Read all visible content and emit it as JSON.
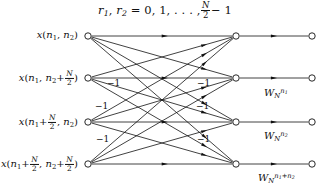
{
  "figure": {
    "type": "signal-flow-graph",
    "title_parts": {
      "r1": "r",
      "r1_sub": "1",
      "r2": "r",
      "r2_sub": "2",
      "equals_values": "= 0, 1, . . . ,",
      "frac_num": "N",
      "frac_den": "2",
      "minus_one": "− 1"
    },
    "background_color": "#ffffff",
    "line_color": "#111111"
  },
  "columns": {
    "input_x": 88,
    "middle_x": 236,
    "output_x": 312,
    "rows_y": [
      36,
      78,
      122,
      164
    ]
  },
  "inputs": [
    {
      "id": "input-node-0",
      "label_text": "x(n1, n2)",
      "x_sym": "x",
      "open": "(",
      "a_base": "n",
      "a_sub": "1",
      "comma": ", ",
      "b_base": "n",
      "b_sub": "2",
      "close": ")",
      "a_has_frac": false,
      "b_has_frac": false
    },
    {
      "id": "input-node-1",
      "label_text": "x(n1, n2 + N/2)",
      "x_sym": "x",
      "open": "(",
      "a_base": "n",
      "a_sub": "1",
      "comma": ", ",
      "b_base": "n",
      "b_sub": "2",
      "close": ")",
      "a_has_frac": false,
      "b_has_frac": true,
      "plus": "+",
      "frac_num": "N",
      "frac_den": "2"
    },
    {
      "id": "input-node-2",
      "label_text": "x(n1 + N/2, n2)",
      "x_sym": "x",
      "open": "(",
      "a_base": "n",
      "a_sub": "1",
      "comma": ", ",
      "b_base": "n",
      "b_sub": "2",
      "close": ")",
      "a_has_frac": true,
      "b_has_frac": false,
      "plus": "+",
      "frac_num": "N",
      "frac_den": "2"
    },
    {
      "id": "input-node-3",
      "label_text": "x(n1 + N/2, n2 + N/2)",
      "x_sym": "x",
      "open": "(",
      "a_base": "n",
      "a_sub": "1",
      "comma": ", ",
      "b_base": "n",
      "b_sub": "2",
      "close": ")",
      "a_has_frac": true,
      "b_has_frac": true,
      "plus": "+",
      "frac_num": "N",
      "frac_den": "2"
    }
  ],
  "twiddles": [
    {
      "id": "twiddle-0",
      "visible": false,
      "base": "",
      "sub": "",
      "sup": ""
    },
    {
      "id": "twiddle-1",
      "visible": true,
      "base": "W",
      "sub": "N",
      "sup": "n1"
    },
    {
      "id": "twiddle-2",
      "visible": true,
      "base": "W",
      "sub": "N",
      "sup": "n2"
    },
    {
      "id": "twiddle-3",
      "visible": true,
      "base": "W",
      "sub": "N",
      "sup": "n1+n2"
    }
  ],
  "minus_one_labels": [
    {
      "id": "minus-one-0",
      "text": "−1",
      "x": 107,
      "y": 83
    },
    {
      "id": "minus-one-1",
      "text": "−1",
      "x": 197,
      "y": 83
    },
    {
      "id": "minus-one-2",
      "text": "−1",
      "x": 95,
      "y": 106
    },
    {
      "id": "minus-one-3",
      "text": "−1",
      "x": 196,
      "y": 106
    },
    {
      "id": "minus-one-4",
      "text": "−1",
      "x": 96,
      "y": 139
    },
    {
      "id": "minus-one-5",
      "text": "−1",
      "x": 197,
      "y": 139
    }
  ]
}
